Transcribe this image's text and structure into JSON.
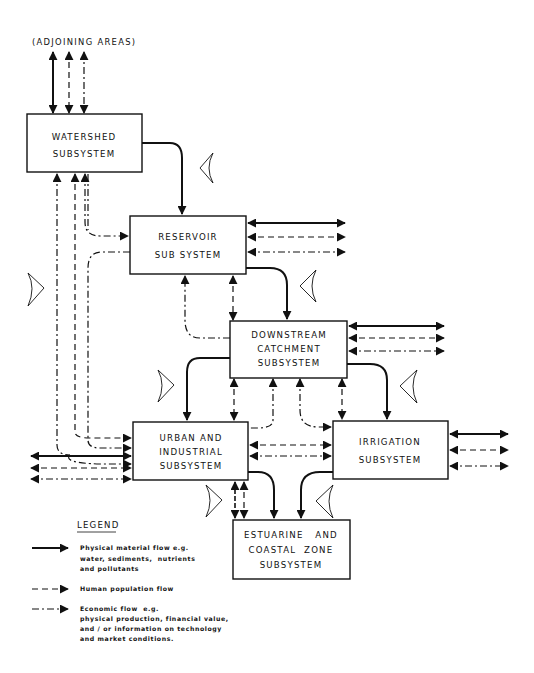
{
  "diagram": {
    "top_label": "(ADJOINING AREAS)",
    "boxes": {
      "watershed": {
        "line1": "WATERSHED",
        "line2": "SUBSYSTEM"
      },
      "reservoir": {
        "line1": "RESERVOIR",
        "line2": "SUB SYSTEM"
      },
      "downstream": {
        "line1": "DOWNSTREAM",
        "line2": "CATCHMENT",
        "line3": "SUBSYSTEM"
      },
      "urban": {
        "line1": "URBAN AND",
        "line2": "INDUSTRIAL",
        "line3": "SUBSYSTEM"
      },
      "irrigation": {
        "line1": "IRRIGATION",
        "line2": "SUBSYSTEM"
      },
      "estuarine": {
        "line1": "ESTUARINE   AND",
        "line2": "COASTAL  ZONE",
        "line3": "SUBSYSTEM"
      }
    },
    "flow_colors": {
      "stroke": "#111111",
      "background": "#ffffff"
    }
  },
  "legend": {
    "title": "LEGEND",
    "items": [
      {
        "type": "physical",
        "line1": "Physical material flow e.g.",
        "line2": "water, sediments,  nutrients",
        "line3": "and pollutants"
      },
      {
        "type": "human",
        "line1": "Human population flow"
      },
      {
        "type": "economic",
        "line1": "Economic flow  e.g.",
        "line2": "physical production, financial value,",
        "line3": "and / or information on technology",
        "line4": "and market conditions."
      }
    ]
  }
}
